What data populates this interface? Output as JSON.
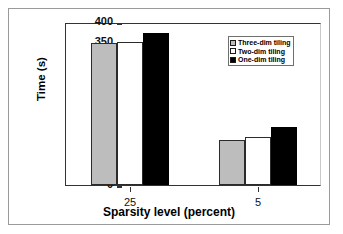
{
  "chart_data": {
    "type": "bar",
    "title": "",
    "xlabel": "Sparsity level (percent)",
    "ylabel": "Time (s)",
    "categories": [
      "25",
      "5"
    ],
    "ylim": [
      0,
      400
    ],
    "yticks": [
      "0",
      "50",
      "100",
      "150",
      "200",
      "250",
      "300",
      "350",
      "400"
    ],
    "ytick_values": [
      0,
      50,
      100,
      150,
      200,
      250,
      300,
      350,
      400
    ],
    "grid": false,
    "legend_position": "upper-right",
    "series": [
      {
        "name": "Three-dim tiling",
        "color": "#bdbdbd",
        "values": [
          348,
          110
        ]
      },
      {
        "name": "Two-dim tiling",
        "color": "#ffffff",
        "values": [
          350,
          117
        ]
      },
      {
        "name": "One-dim tiling",
        "color": "#000000",
        "values": [
          372,
          142
        ]
      }
    ]
  },
  "figure": {
    "background": "#ffffff",
    "frame_color": "#9a9a9a",
    "axis_color": "#333333"
  }
}
